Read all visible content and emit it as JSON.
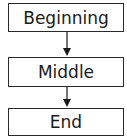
{
  "diagram": {
    "type": "flowchart",
    "direction": "top-to-bottom",
    "nodes": [
      {
        "id": "beginning",
        "label": "Beginning"
      },
      {
        "id": "middle",
        "label": "Middle"
      },
      {
        "id": "end",
        "label": "End"
      }
    ],
    "edges": [
      {
        "from": "beginning",
        "to": "middle"
      },
      {
        "from": "middle",
        "to": "end"
      }
    ]
  }
}
